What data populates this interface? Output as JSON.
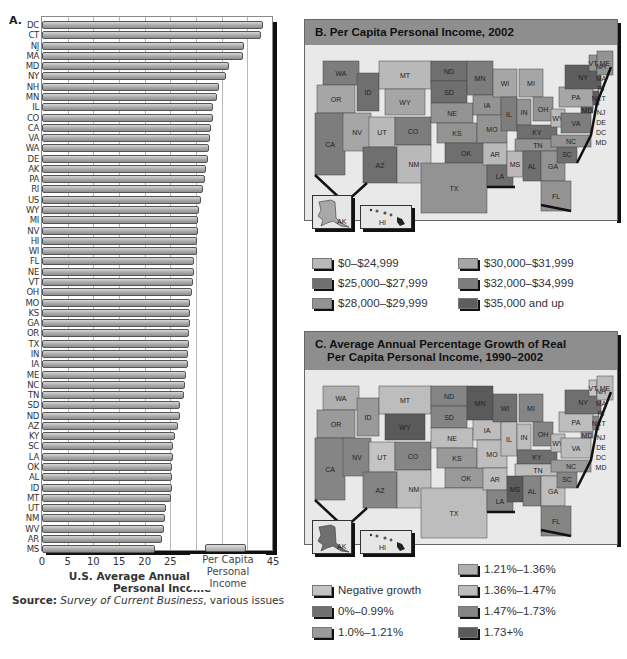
{
  "panel_a": {
    "letter": "A.",
    "legend_label_line1": "Per Capita",
    "legend_label_line2": "Personal Income",
    "xlabel": "U.S. Average Annual Per Capita Personal Income",
    "source_label": "Source:",
    "source_title": "Survey of Current Business",
    "source_rest": ", various issues"
  },
  "panel_b": {
    "title": "B. Per Capita Personal Income, 2002",
    "legend": [
      {
        "label": "$0–$24,999",
        "color": "#b9b9b9"
      },
      {
        "label": "$25,000–$27,999",
        "color": "#6f6f6f"
      },
      {
        "label": "$28,000–$29,999",
        "color": "#939393"
      },
      {
        "label": "$30,000–$31,999",
        "color": "#a6a6a6"
      },
      {
        "label": "$32,000–$34,999",
        "color": "#7d7d7d"
      },
      {
        "label": "$35,000 and up",
        "color": "#5e5e5e"
      }
    ]
  },
  "panel_c": {
    "title_line1": "C. Average Annual Percentage Growth of Real",
    "title_line2": "Per Capita Personal Income, 1990–2002",
    "legend": [
      {
        "label": "Negative growth",
        "color": "#c4c4c4"
      },
      {
        "label": "0%–0.99%",
        "color": "#6f6f6f"
      },
      {
        "label": "1.0%–1.21%",
        "color": "#9a9a9a"
      },
      {
        "label": "1.21%–1.36%",
        "color": "#b0b0b0"
      },
      {
        "label": "1.36%–1.47%",
        "color": "#bdbdbd"
      },
      {
        "label": "1.47%–1.73%",
        "color": "#858585"
      },
      {
        "label": "1.73+%",
        "color": "#5a5a5a"
      }
    ]
  },
  "inset_labels": {
    "ak": "AK",
    "hi": "HI"
  },
  "chart_data": [
    {
      "type": "bar",
      "orientation": "horizontal",
      "title": "A.",
      "xlabel": "U.S. Average Annual Per Capita Personal Income",
      "ylabel": "",
      "xlim": [
        0,
        45
      ],
      "xticks": [
        0,
        5,
        10,
        15,
        20,
        25,
        30,
        35,
        40,
        45
      ],
      "grid": true,
      "legend": [
        "Per Capita Personal Income"
      ],
      "legend_position": "lower right",
      "categories": [
        "DC",
        "CT",
        "NJ",
        "MA",
        "MD",
        "NY",
        "NH",
        "MN",
        "IL",
        "CO",
        "CA",
        "VA",
        "WA",
        "DE",
        "AK",
        "PA",
        "RI",
        "US",
        "WY",
        "MI",
        "NV",
        "HI",
        "WI",
        "FL",
        "NE",
        "VT",
        "OH",
        "MO",
        "KS",
        "GA",
        "OR",
        "TX",
        "IN",
        "IA",
        "ME",
        "NC",
        "TN",
        "SD",
        "ND",
        "AZ",
        "KY",
        "SC",
        "LA",
        "OK",
        "AL",
        "ID",
        "MT",
        "UT",
        "NM",
        "WV",
        "AR",
        "MS"
      ],
      "values": [
        43.0,
        42.6,
        39.4,
        39.1,
        36.4,
        35.8,
        34.5,
        34.0,
        33.4,
        33.3,
        33.0,
        32.7,
        32.6,
        32.4,
        31.9,
        31.7,
        31.3,
        31.0,
        30.6,
        30.4,
        30.4,
        30.2,
        30.1,
        29.6,
        29.6,
        29.4,
        29.3,
        28.9,
        28.9,
        28.8,
        28.7,
        28.6,
        28.5,
        28.4,
        28.1,
        27.8,
        27.6,
        26.9,
        26.8,
        26.4,
        25.9,
        25.6,
        25.5,
        25.4,
        25.4,
        25.3,
        25.1,
        24.1,
        23.9,
        23.7,
        23.4,
        22.1
      ],
      "units": "thousands of dollars"
    },
    {
      "type": "choropleth",
      "title": "B. Per Capita Personal Income, 2002",
      "legend": [
        "$0–$24,999",
        "$25,000–$27,999",
        "$28,000–$29,999",
        "$30,000–$31,999",
        "$32,000–$34,999",
        "$35,000 and up"
      ]
    },
    {
      "type": "choropleth",
      "title": "C. Average Annual Percentage Growth of Real Per Capita Personal Income, 1990–2002",
      "legend": [
        "Negative growth",
        "0%–0.99%",
        "1.0%–1.21%",
        "1.21%–1.36%",
        "1.36%–1.47%",
        "1.47%–1.73%",
        "1.73+%"
      ]
    }
  ]
}
